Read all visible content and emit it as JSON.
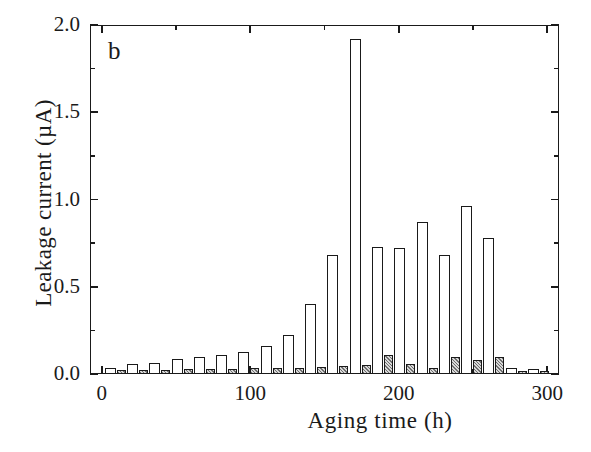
{
  "chart_data": {
    "type": "bar",
    "title": "",
    "panel_label": "b",
    "xlabel": "Aging time  (h)",
    "ylabel": "Leakage current  (µA)",
    "xlim": [
      -8,
      308
    ],
    "ylim": [
      0.0,
      2.0
    ],
    "grid": false,
    "legend_position": "none",
    "x_ticks_major": [
      0,
      100,
      200,
      300
    ],
    "x_tick_labels": [
      "0",
      "100",
      "200",
      "300"
    ],
    "x_ticks_minor": [
      50,
      150,
      250
    ],
    "y_ticks_major": [
      0.0,
      0.5,
      1.0,
      1.5,
      2.0
    ],
    "y_tick_labels": [
      "0.0",
      "0.5",
      "1.0",
      "1.5",
      "2.0"
    ],
    "y_ticks_minor": [
      0.25,
      0.75,
      1.25,
      1.75
    ],
    "x": [
      2,
      17,
      32,
      47,
      62,
      77,
      92,
      107,
      122,
      137,
      152,
      167,
      182,
      197,
      212,
      227,
      242,
      257,
      272,
      287
    ],
    "series": [
      {
        "name": "open bar",
        "style": "white-open",
        "values": [
          0.035,
          0.06,
          0.065,
          0.085,
          0.095,
          0.11,
          0.125,
          0.16,
          0.225,
          0.4,
          0.68,
          1.92,
          0.73,
          0.72,
          0.87,
          0.68,
          0.96,
          0.78,
          0.035,
          0.03
        ]
      },
      {
        "name": "hatched bar",
        "style": "gray-hatched",
        "values": [
          0.025,
          0.025,
          0.025,
          0.03,
          0.03,
          0.03,
          0.035,
          0.035,
          0.035,
          0.04,
          0.045,
          0.05,
          0.11,
          0.06,
          0.035,
          0.095,
          0.08,
          0.1,
          0.02,
          0.02
        ]
      }
    ]
  },
  "figure": {
    "background_color": "#ffffff",
    "ink_color": "#1a1a1a"
  }
}
